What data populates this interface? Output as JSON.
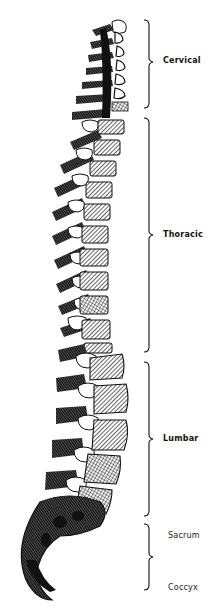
{
  "figure": {
    "ink_color": "#111111",
    "background": "#ffffff"
  },
  "regions": [
    {
      "key": "cervical",
      "label": "Cervical",
      "bracket_top": 20,
      "bracket_bottom": 108,
      "label_y": 61
    },
    {
      "key": "thoracic",
      "label": "Thoracic",
      "bracket_top": 118,
      "bracket_bottom": 352,
      "label_y": 235
    },
    {
      "key": "lumbar",
      "label": "Lumbar",
      "bracket_top": 362,
      "bracket_bottom": 516,
      "label_y": 439
    },
    {
      "key": "sacrum",
      "label": "Sacrum",
      "bracket_top": 524,
      "bracket_bottom": 590,
      "label_y": 536
    },
    {
      "key": "coccyx",
      "label": "Coccyx",
      "label_y": 587
    }
  ]
}
